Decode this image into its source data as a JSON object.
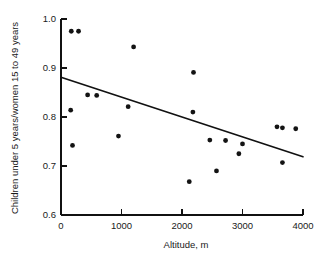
{
  "chart_data": {
    "type": "scatter",
    "title": "",
    "xlabel": "Altitude, m",
    "ylabel": "Children under 5 years/women 15 to 49 years",
    "xlim": [
      0,
      4000
    ],
    "ylim": [
      0.6,
      1.0
    ],
    "grid": false,
    "legend": null,
    "xticks": [
      0,
      1000,
      2000,
      3000,
      4000
    ],
    "xtick_labels": [
      "0",
      "1000",
      "2000",
      "3000",
      "4000"
    ],
    "yticks": [
      0.6,
      0.7,
      0.8,
      0.9,
      1.0
    ],
    "ytick_labels": [
      "0.6",
      "0.7",
      "0.8",
      "0.9",
      "1.0"
    ],
    "series": [
      {
        "name": "observations",
        "marker": "filled-circle",
        "color": "#131313",
        "points": [
          {
            "x": 170,
            "y": 0.975
          },
          {
            "x": 290,
            "y": 0.975
          },
          {
            "x": 1200,
            "y": 0.943
          },
          {
            "x": 2190,
            "y": 0.891
          },
          {
            "x": 440,
            "y": 0.845
          },
          {
            "x": 590,
            "y": 0.844
          },
          {
            "x": 1110,
            "y": 0.821
          },
          {
            "x": 2180,
            "y": 0.81
          },
          {
            "x": 160,
            "y": 0.814
          },
          {
            "x": 3570,
            "y": 0.78
          },
          {
            "x": 3660,
            "y": 0.778
          },
          {
            "x": 3880,
            "y": 0.776
          },
          {
            "x": 950,
            "y": 0.761
          },
          {
            "x": 2460,
            "y": 0.753
          },
          {
            "x": 2720,
            "y": 0.752
          },
          {
            "x": 3000,
            "y": 0.745
          },
          {
            "x": 190,
            "y": 0.742
          },
          {
            "x": 2940,
            "y": 0.725
          },
          {
            "x": 3660,
            "y": 0.707
          },
          {
            "x": 2570,
            "y": 0.69
          },
          {
            "x": 2120,
            "y": 0.668
          }
        ]
      }
    ],
    "trend_line": {
      "name": "fitted-regression-line",
      "x_start": 0,
      "y_start": 0.881,
      "x_end": 4000,
      "y_end": 0.719
    }
  }
}
